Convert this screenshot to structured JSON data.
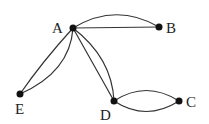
{
  "diagram": {
    "type": "multigraph",
    "nodes": [
      {
        "id": "A",
        "label": "A",
        "x": 73,
        "y": 28
      },
      {
        "id": "B",
        "label": "B",
        "x": 159,
        "y": 27
      },
      {
        "id": "C",
        "label": "C",
        "x": 179,
        "y": 101
      },
      {
        "id": "D",
        "label": "D",
        "x": 114,
        "y": 101
      },
      {
        "id": "E",
        "label": "E",
        "x": 20,
        "y": 94
      }
    ],
    "edges": [
      {
        "from": "A",
        "to": "B",
        "count": 2
      },
      {
        "from": "A",
        "to": "E",
        "count": 2
      },
      {
        "from": "A",
        "to": "D",
        "count": 2
      },
      {
        "from": "D",
        "to": "C",
        "count": 2
      }
    ]
  }
}
